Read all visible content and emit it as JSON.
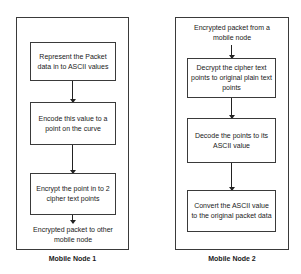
{
  "node1": {
    "label": "Mobile Node 1",
    "steps": [
      "Represent the Packet data in to ASCII values",
      "Encode this value to a point on the curve",
      "Encrypt the point in to 2 cipher text points"
    ],
    "output": "Encrypted packet to other mobile node"
  },
  "node2": {
    "label": "Mobile Node 2",
    "input": "Encrypted packet from a mobile node",
    "steps": [
      "Decrypt the cipher text points to original plain text points",
      "Decode the points to its ASCII value",
      "Convert the ASCII value to the original packet data"
    ]
  },
  "colors": {
    "stroke": "#3a3a3a",
    "text": "#1a1a1a",
    "background": "#ffffff"
  }
}
